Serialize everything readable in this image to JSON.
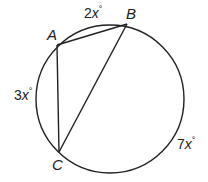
{
  "diagram": {
    "type": "inscribed-triangle-in-circle",
    "points": [
      {
        "id": "A",
        "label": "A"
      },
      {
        "id": "B",
        "label": "B"
      },
      {
        "id": "C",
        "label": "C"
      }
    ],
    "segments": [
      [
        "A",
        "B"
      ],
      [
        "A",
        "C"
      ],
      [
        "B",
        "C"
      ]
    ],
    "arcs": [
      {
        "between": [
          "A",
          "B"
        ],
        "coef": "2",
        "var": "x",
        "unit": "°",
        "text": "2x°"
      },
      {
        "between": [
          "A",
          "C"
        ],
        "coef": "3",
        "var": "x",
        "unit": "°",
        "text": "3x°"
      },
      {
        "between": [
          "B",
          "C"
        ],
        "coef": "7",
        "var": "x",
        "unit": "°",
        "text": "7x°"
      }
    ],
    "stroke_color": "#222222"
  }
}
